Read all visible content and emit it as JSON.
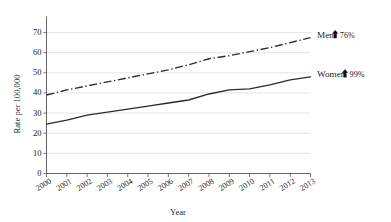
{
  "chart_data": {
    "type": "line",
    "title": "",
    "xlabel": "Year",
    "ylabel": "Rate per 100,000",
    "x": [
      2000,
      2001,
      2002,
      2003,
      2004,
      2005,
      2006,
      2007,
      2008,
      2009,
      2010,
      2011,
      2012,
      2013
    ],
    "categories": [
      "2000",
      "2001",
      "2002",
      "2003",
      "2004",
      "2005",
      "2006",
      "2007",
      "2008",
      "2009",
      "2010",
      "2011",
      "2012",
      "2013"
    ],
    "xlim": [
      2000,
      2013
    ],
    "ylim": [
      0,
      75
    ],
    "yticks": [
      0,
      10,
      20,
      30,
      40,
      50,
      60,
      70
    ],
    "ytick_labels": [
      "0",
      "10",
      "20",
      "30",
      "40",
      "50",
      "60",
      "70"
    ],
    "grid": true,
    "legend_position": "right-inline-annotations",
    "series": [
      {
        "name": "Men",
        "style": "dash-dot",
        "values": [
          39.0,
          41.5,
          43.5,
          45.5,
          47.5,
          49.5,
          51.5,
          54.0,
          57.0,
          58.5,
          60.5,
          62.5,
          65.0,
          67.5
        ]
      },
      {
        "name": "Women",
        "style": "solid",
        "values": [
          24.5,
          26.5,
          29.0,
          30.5,
          32.0,
          33.5,
          35.0,
          36.5,
          39.5,
          41.5,
          42.0,
          44.0,
          46.5,
          48.0
        ]
      }
    ],
    "annotations": [
      {
        "label": "Men",
        "arrow": "up",
        "value": "76%"
      },
      {
        "label": "Women",
        "arrow": "up",
        "value": "99%"
      }
    ]
  }
}
